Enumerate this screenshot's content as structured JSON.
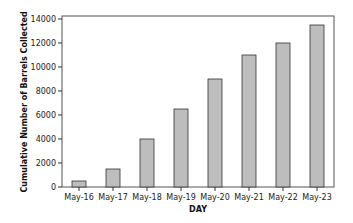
{
  "chart_data": {
    "type": "bar",
    "title": "",
    "xlabel": "DAY",
    "ylabel": "Cumulative Number of Barrels Collected",
    "categories": [
      "May-16",
      "May-17",
      "May-18",
      "May-19",
      "May-20",
      "May-21",
      "May-22",
      "May-23"
    ],
    "values": [
      500,
      1500,
      4000,
      6500,
      9000,
      11000,
      12000,
      13500
    ],
    "ylim": [
      0,
      14000
    ],
    "yticks": [
      0,
      2000,
      4000,
      6000,
      8000,
      10000,
      12000,
      14000
    ],
    "grid": false,
    "legend": null,
    "colors": {
      "bar_fill": "#bdbdbd",
      "bar_stroke": "#333333",
      "frame": "#555555"
    }
  }
}
